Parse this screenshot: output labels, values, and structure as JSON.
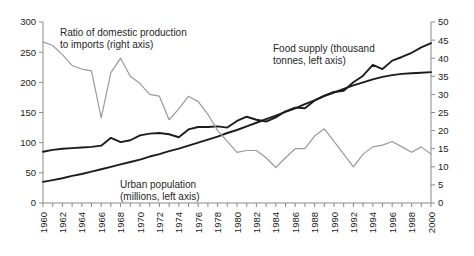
{
  "chart_data": {
    "type": "line",
    "title": "",
    "xlabel": "",
    "ylabel": "",
    "grid": false,
    "legend_position": "inline-annotations",
    "x": [
      1960,
      1961,
      1962,
      1963,
      1964,
      1965,
      1966,
      1967,
      1968,
      1969,
      1970,
      1971,
      1972,
      1973,
      1974,
      1975,
      1976,
      1977,
      1978,
      1979,
      1980,
      1981,
      1982,
      1983,
      1984,
      1985,
      1986,
      1987,
      1988,
      1989,
      1990,
      1991,
      1992,
      1993,
      1994,
      1995,
      1996,
      1997,
      1998,
      1999,
      2000
    ],
    "xtick_labels": [
      "1960",
      "1962",
      "1964",
      "1966",
      "1968",
      "1970",
      "1972",
      "1974",
      "1976",
      "1978",
      "1980",
      "1982",
      "1984",
      "1986",
      "1988",
      "1990",
      "1992",
      "1994",
      "1996",
      "1998",
      "2000"
    ],
    "left_axis": {
      "label": "",
      "ylim": [
        0,
        300
      ],
      "ticks": [
        0,
        50,
        100,
        150,
        200,
        250,
        300
      ],
      "tick_labels": [
        "0",
        "50",
        "100",
        "150",
        "200",
        "250",
        "300"
      ]
    },
    "right_axis": {
      "label": "",
      "ylim": [
        0,
        50
      ],
      "ticks": [
        0,
        5,
        10,
        15,
        20,
        25,
        30,
        35,
        40,
        45,
        50
      ],
      "tick_labels": [
        "0",
        "5",
        "10",
        "15",
        "20",
        "25",
        "30",
        "35",
        "40",
        "45",
        "50"
      ]
    },
    "series": [
      {
        "name": "Food supply (thousand tonnes, left axis)",
        "axis": "left",
        "color": "#1c1c1c",
        "style": "dark-thick",
        "values": [
          85,
          88,
          90,
          91,
          92,
          93,
          95,
          108,
          101,
          104,
          112,
          115,
          116,
          114,
          109,
          122,
          126,
          126,
          127,
          125,
          136,
          143,
          138,
          135,
          142,
          152,
          158,
          157,
          170,
          178,
          184,
          186,
          200,
          211,
          229,
          222,
          236,
          242,
          249,
          258,
          265
        ]
      },
      {
        "name": "Urban population (millions, left axis)",
        "axis": "left",
        "color": "#1c1c1c",
        "style": "dark-thick",
        "values": [
          35,
          38,
          41,
          45,
          48,
          52,
          56,
          60,
          64,
          68,
          72,
          77,
          81,
          86,
          90,
          95,
          100,
          105,
          110,
          116,
          121,
          127,
          133,
          139,
          145,
          151,
          157,
          164,
          170,
          177,
          183,
          189,
          195,
          200,
          205,
          209,
          212,
          214,
          215,
          216,
          217
        ]
      },
      {
        "name": "Ratio of domestic production to imports (right axis)",
        "axis": "right",
        "color": "#9a9a9a",
        "style": "light-thin",
        "values": [
          44.5,
          43.5,
          41,
          38,
          37,
          36.5,
          23.5,
          36,
          40,
          35,
          33,
          30,
          29.5,
          23,
          26,
          29.5,
          28,
          24.5,
          20,
          17,
          14,
          14.5,
          14.5,
          12.5,
          9.8,
          12.5,
          15,
          15,
          18.5,
          20.5,
          17,
          13.5,
          10,
          13.5,
          15.5,
          16,
          17,
          15.5,
          14,
          15.5,
          13.5
        ]
      }
    ],
    "annotations": [
      {
        "name": "ratio-annotation",
        "lines": [
          "Ratio of domestic production",
          "to imports (right axis)"
        ],
        "x": 60,
        "y": 36
      },
      {
        "name": "food-supply-annotation",
        "lines": [
          "Food supply (thousand",
          "tonnes, left axis)"
        ],
        "x": 273,
        "y": 52
      },
      {
        "name": "urban-population-annotation",
        "lines": [
          "Urban population",
          "(millions, left axis)"
        ],
        "x": 120,
        "y": 188
      }
    ]
  }
}
